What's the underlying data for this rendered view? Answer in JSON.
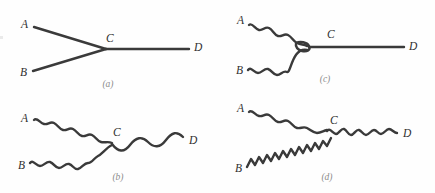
{
  "figure": {
    "background_color": "#fefefe",
    "stroke_color": "#3a3a3a",
    "label_color": "#2f2f2f",
    "caption_color": "#8c8c8c"
  },
  "panels": [
    {
      "id": "a",
      "caption": "(a)",
      "nodes": {
        "A": "A",
        "B": "B",
        "C": "C",
        "D": "D"
      },
      "legs": [
        {
          "name": "A-to-C",
          "style": "straight"
        },
        {
          "name": "B-to-C",
          "style": "straight"
        },
        {
          "name": "C-to-D",
          "style": "straight"
        }
      ]
    },
    {
      "id": "c",
      "caption": "(c)",
      "nodes": {
        "A": "A",
        "B": "B",
        "C": "C",
        "D": "D"
      },
      "legs": [
        {
          "name": "A-to-C",
          "style": "wavy"
        },
        {
          "name": "B-to-C",
          "style": "wavy"
        },
        {
          "name": "C-to-D",
          "style": "straight"
        }
      ]
    },
    {
      "id": "b",
      "caption": "(b)",
      "nodes": {
        "A": "A",
        "B": "B",
        "C": "C",
        "D": "D"
      },
      "legs": [
        {
          "name": "A-to-C",
          "style": "wavy"
        },
        {
          "name": "B-to-C",
          "style": "wavy"
        },
        {
          "name": "C-to-D",
          "style": "wavy-long"
        }
      ]
    },
    {
      "id": "d",
      "caption": "(d)",
      "nodes": {
        "A": "A",
        "B": "B",
        "C": "C",
        "D": "D"
      },
      "legs": [
        {
          "name": "A-to-C",
          "style": "wavy"
        },
        {
          "name": "B-to-C",
          "style": "wavy-tight"
        },
        {
          "name": "C-to-D",
          "style": "wavy-medium"
        }
      ]
    }
  ]
}
